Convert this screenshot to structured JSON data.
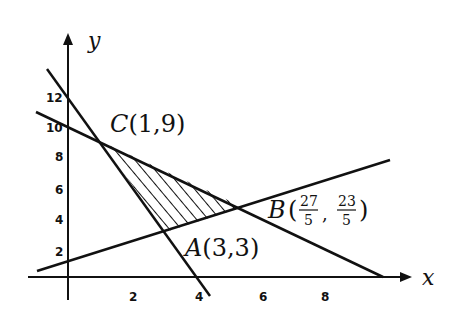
{
  "diagram": {
    "type": "linear-programming-feasible-region",
    "axes": {
      "x_label": "x",
      "y_label": "y",
      "x_ticks": [
        "2",
        "4",
        "6",
        "8"
      ],
      "y_ticks": [
        "2",
        "4",
        "6",
        "8",
        "10",
        "12"
      ]
    },
    "points": {
      "A": {
        "label": "A(3,3)",
        "name": "A",
        "coords": "(3,3)"
      },
      "B": {
        "label": "B(27/5, 23/5)",
        "name": "B",
        "x_num": "27",
        "x_den": "5",
        "y_num": "23",
        "y_den": "5"
      },
      "C": {
        "label": "C(1,9)",
        "name": "C",
        "coords": "(1,9)"
      }
    },
    "lines": [
      {
        "name": "steep-line",
        "description": "passes through (0,12), C(1,9), A(3,3), (4,0)"
      },
      {
        "name": "upper-line",
        "description": "passes through (0,10), C(1,9), B(27/5,23/5), meets x-axis near x=10"
      },
      {
        "name": "lower-line",
        "description": "passes through A(3,3), B(27/5,23/5), extends upward to the right"
      }
    ],
    "region": {
      "description": "hatched triangle ABC (feasible region)"
    },
    "colors": {
      "ink": "#111111",
      "background": "#ffffff"
    }
  }
}
